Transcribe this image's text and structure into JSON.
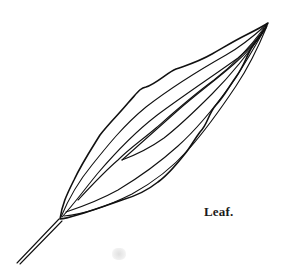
{
  "figure": {
    "caption": "Leaf.",
    "stroke_color": "#111111",
    "background_color": "#ffffff"
  }
}
